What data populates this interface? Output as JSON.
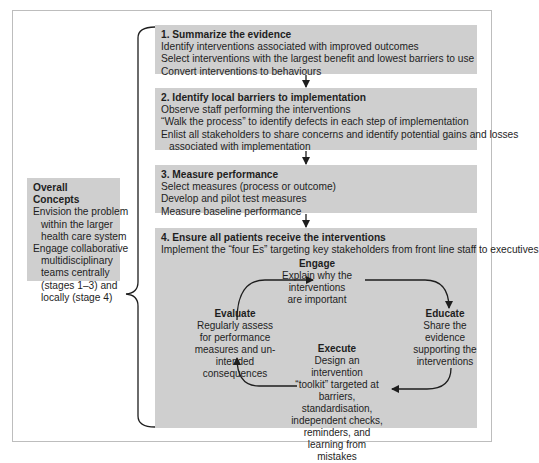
{
  "stages": [
    {
      "title": "1. Summarize the evidence",
      "lines": [
        "Identify interventions associated with improved outcomes",
        "Select interventions with the largest benefit and lowest barriers to use",
        "Convert interventions to behaviours"
      ]
    },
    {
      "title": "2. Identify local barriers to implementation",
      "lines": [
        "Observe staff performing the interventions",
        "“Walk the process” to identify defects in each step of implementation",
        "Enlist all stakeholders to share concerns and identify potential gains and losses",
        "associated with implementation"
      ]
    },
    {
      "title": "3. Measure performance",
      "lines": [
        "Select measures (process or outcome)",
        "Develop and pilot test measures",
        "Measure baseline performance"
      ]
    },
    {
      "title": "4. Ensure all patients receive the interventions",
      "lines": [
        "Implement the “four Es” targeting key stakeholders from front line staff to executives"
      ]
    }
  ],
  "cycle": {
    "engage": {
      "title": "Engage",
      "lines": [
        "Explain why the",
        "interventions",
        "are important"
      ]
    },
    "educate": {
      "title": "Educate",
      "lines": [
        "Share the",
        "evidence",
        "supporting the",
        "interventions"
      ]
    },
    "execute": {
      "title": "Execute",
      "lines": [
        "Design an intervention",
        "“toolkit” targeted at",
        "barriers, standardisation,",
        "independent checks,",
        "reminders, and",
        "learning from mistakes"
      ]
    },
    "evaluate": {
      "title": "Evaluate",
      "lines": [
        "Regularly assess",
        "for performance",
        "measures and un-",
        "intended consequences"
      ]
    }
  },
  "overall_concepts": {
    "title": "Overall Concepts",
    "lines": [
      "Envision the problem",
      "within the larger",
      "health care system",
      "Engage collaborative",
      "multidisciplinary",
      "teams centrally",
      "(stages 1–3) and",
      "locally (stage 4)"
    ]
  },
  "colors": {
    "box_fill": "#cfcfcf",
    "line": "#1e1e1e",
    "frame": "#bdbdbd"
  }
}
